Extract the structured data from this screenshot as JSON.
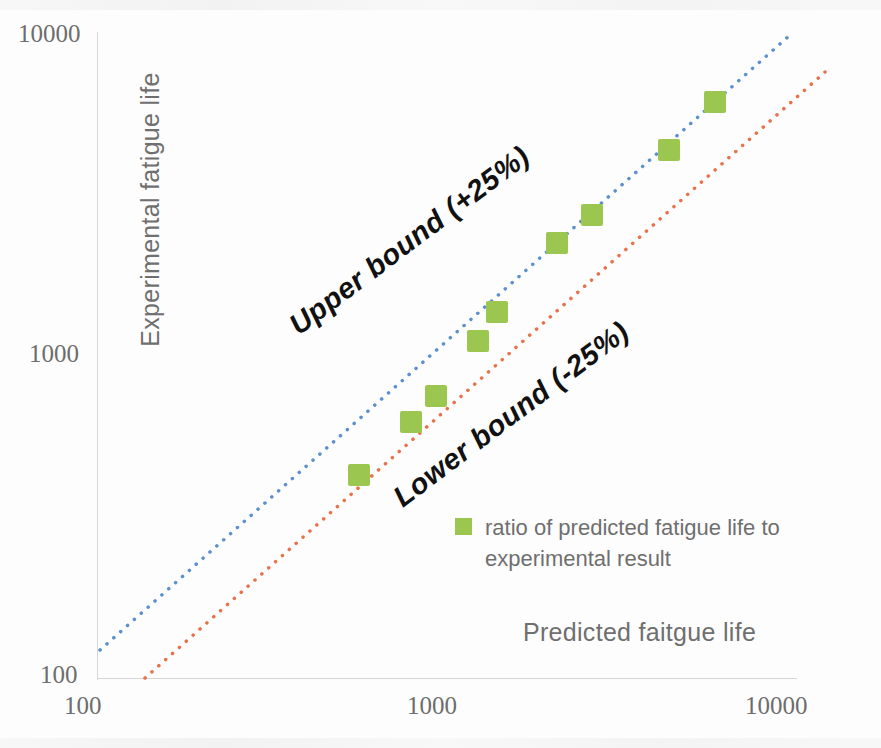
{
  "chart_data": {
    "type": "scatter",
    "title": "",
    "xlabel": "Predicted faitgue life",
    "ylabel": "Experimental fatigue life",
    "xscale": "log",
    "yscale": "log",
    "xlim": [
      100,
      10000
    ],
    "ylim": [
      100,
      10000
    ],
    "grid": false,
    "xticks": [
      "100",
      "1000",
      "10000"
    ],
    "yticks": [
      "100",
      "1000",
      "10000"
    ],
    "legend_position": "inside-lower-right",
    "series": [
      {
        "name": "ratio of predicted fatigue life to experimental result",
        "type": "scatter",
        "marker": "square",
        "color": "#9BC750",
        "points": [
          {
            "x": 560,
            "y": 430
          },
          {
            "x": 790,
            "y": 630
          },
          {
            "x": 930,
            "y": 760
          },
          {
            "x": 1230,
            "y": 1130
          },
          {
            "x": 1390,
            "y": 1390
          },
          {
            "x": 2060,
            "y": 2280
          },
          {
            "x": 2600,
            "y": 2800
          },
          {
            "x": 4310,
            "y": 4460
          },
          {
            "x": 5830,
            "y": 6320
          }
        ]
      },
      {
        "name": "Upper bound (+25%)",
        "type": "line",
        "style": "dotted",
        "color": "#5B8FD0",
        "endpoints": [
          {
            "x": 102,
            "y": 128
          },
          {
            "x": 7900,
            "y": 10000
          }
        ]
      },
      {
        "name": "Lower bound (-25%)",
        "type": "line",
        "style": "dotted",
        "color": "#E8714A",
        "endpoints": [
          {
            "x": 133,
            "y": 100
          },
          {
            "x": 10000,
            "y": 7650
          }
        ]
      }
    ],
    "annotations": [
      {
        "text": "Upper bound (+25%)",
        "rotation": -37
      },
      {
        "text": "Lower bound (-25%)",
        "rotation": -37
      }
    ]
  },
  "axes": {
    "y_title": "Experimental fatigue life",
    "x_title": "Predicted faitgue life",
    "y_ticks": {
      "top": "10000",
      "mid": "1000",
      "bottom": "100"
    },
    "x_ticks": {
      "left": "100",
      "mid": "1000",
      "right": "10000"
    }
  },
  "annotations": {
    "upper_bound": "Upper bound (+25%)",
    "lower_bound": "Lower bound (-25%)"
  },
  "legend": {
    "label": "ratio of predicted fatigue life to experimental result",
    "swatch_color": "#9BC750"
  },
  "colors": {
    "marker_green": "#9BC750",
    "upper_bound_blue": "#5B8FD0",
    "lower_bound_red": "#E8714A",
    "axis_gray": "#d6d6d6",
    "text_gray": "#6f6f6f"
  }
}
